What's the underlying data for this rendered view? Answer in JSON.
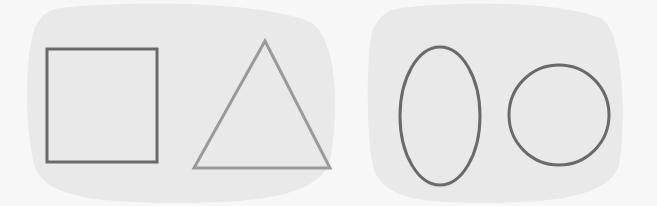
{
  "figure": {
    "background_color": "#f7f7f7",
    "panel_color": "#e9e9e9",
    "panels": [
      {
        "id": "left-panel",
        "shapes": [
          {
            "type": "square",
            "stroke": "#6a6a6a",
            "x": 47,
            "y": 49,
            "width": 110,
            "height": 113
          },
          {
            "type": "triangle",
            "stroke": "#9a9a9a",
            "points": [
              [
                265,
                41
              ],
              [
                194,
                168
              ],
              [
                330,
                168
              ]
            ]
          }
        ]
      },
      {
        "id": "right-panel",
        "shapes": [
          {
            "type": "ellipse",
            "stroke": "#6a6a6a",
            "cx": 440,
            "cy": 116,
            "rx": 40,
            "ry": 69
          },
          {
            "type": "circle",
            "stroke": "#6a6a6a",
            "cx": 559,
            "cy": 115,
            "r": 50
          }
        ]
      }
    ]
  }
}
